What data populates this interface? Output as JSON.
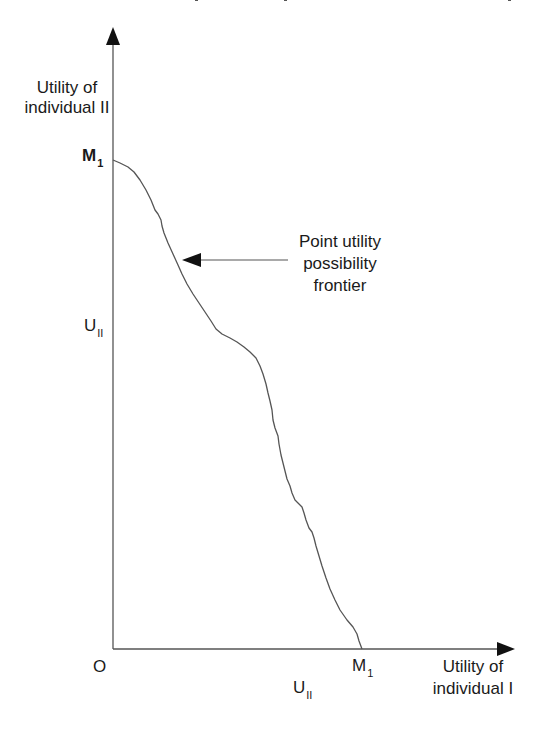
{
  "diagram": {
    "type": "utility possibility frontier",
    "y_axis": {
      "label_line1": "Utility of",
      "label_line2": "individual II",
      "max_label": "M",
      "max_label_sub": "1",
      "mid_label": "U",
      "mid_label_sub": "II"
    },
    "x_axis": {
      "label_line1": "Utility of",
      "label_line2": "individual I",
      "max_label": "M",
      "max_label_sub": "1",
      "mid_label": "U",
      "mid_label_sub": "II"
    },
    "origin_label": "O",
    "annotation": {
      "line1": "Point utility",
      "line2": "possibility",
      "line3": "frontier"
    },
    "colors": {
      "axis": "#555555",
      "curve": "#555555",
      "arrowhead": "#111111",
      "text": "#1a1a1a"
    }
  }
}
